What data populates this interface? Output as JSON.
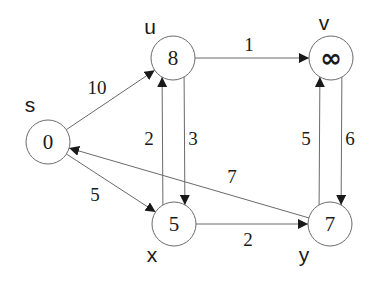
{
  "diagram": {
    "type": "directed-weighted-graph",
    "colors": {
      "stroke": "#6a6a6a",
      "text": "#1a1a1a",
      "background": "#ffffff"
    },
    "nodes": [
      {
        "id": "s",
        "name": "s",
        "distance": "0",
        "cx": 48,
        "cy": 142,
        "label_x": 30,
        "label_y": 112
      },
      {
        "id": "u",
        "name": "u",
        "distance": "8",
        "cx": 173,
        "cy": 58,
        "label_x": 150,
        "label_y": 34
      },
      {
        "id": "v",
        "name": "v",
        "distance": "∞",
        "cx": 331,
        "cy": 58,
        "label_x": 324,
        "label_y": 30
      },
      {
        "id": "x",
        "name": "x",
        "distance": "5",
        "cx": 174,
        "cy": 224,
        "label_x": 152,
        "label_y": 262
      },
      {
        "id": "y",
        "name": "y",
        "distance": "7",
        "cx": 330,
        "cy": 224,
        "label_x": 304,
        "label_y": 262
      }
    ],
    "edges": [
      {
        "from": "s",
        "to": "u",
        "weight": "10",
        "label_x": 97,
        "label_y": 94
      },
      {
        "from": "s",
        "to": "x",
        "weight": "5",
        "label_x": 95,
        "label_y": 201
      },
      {
        "from": "u",
        "to": "v",
        "weight": "1",
        "label_x": 249,
        "label_y": 51
      },
      {
        "from": "u",
        "to": "x",
        "weight": "2",
        "label_x": 149,
        "label_y": 145
      },
      {
        "from": "x",
        "to": "u",
        "weight": "3",
        "label_x": 193,
        "label_y": 145
      },
      {
        "from": "v",
        "to": "y",
        "weight": "5",
        "label_x": 306,
        "label_y": 145
      },
      {
        "from": "y",
        "to": "v",
        "weight": "6",
        "label_x": 350,
        "label_y": 145
      },
      {
        "from": "x",
        "to": "y",
        "weight": "2",
        "label_x": 248,
        "label_y": 246
      },
      {
        "from": "y",
        "to": "s",
        "weight": "7",
        "label_x": 232,
        "label_y": 183
      }
    ]
  }
}
